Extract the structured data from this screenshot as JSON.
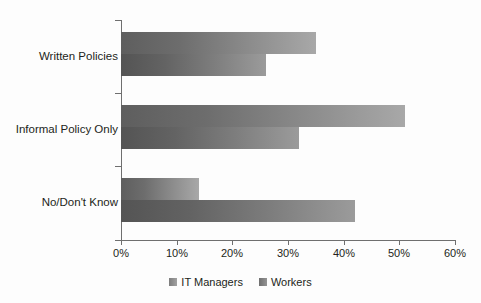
{
  "chart_data": {
    "type": "bar",
    "orientation": "horizontal",
    "title": "",
    "xlabel": "",
    "ylabel": "",
    "xlim": [
      0,
      60
    ],
    "xticks": [
      "0%",
      "10%",
      "20%",
      "30%",
      "40%",
      "50%",
      "60%"
    ],
    "xtick_values": [
      0,
      10,
      20,
      30,
      40,
      50,
      60
    ],
    "grid": false,
    "legend_position": "bottom",
    "categories": [
      "Written Policies",
      "Informal Policy Only",
      "No/Don't Know"
    ],
    "series": [
      {
        "name": "IT Managers",
        "values": [
          35,
          51,
          14
        ],
        "color": "#8b8b8b"
      },
      {
        "name": "Workers",
        "values": [
          26,
          32,
          42
        ],
        "color": "#7e7e7e"
      }
    ]
  },
  "legend": {
    "items": [
      {
        "label": "IT Managers",
        "swatch": "it-managers"
      },
      {
        "label": "Workers",
        "swatch": "workers"
      }
    ]
  }
}
